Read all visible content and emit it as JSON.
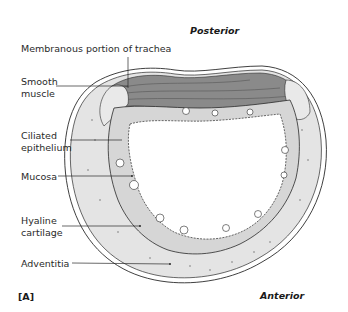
{
  "figure": {
    "panel_label": "[A]",
    "orientation": {
      "top": "Posterior",
      "bottom": "Anterior"
    },
    "labels": {
      "membranous": "Membranous portion of trachea",
      "smooth_muscle_1": "Smooth",
      "smooth_muscle_2": "muscle",
      "ciliated_1": "Ciliated",
      "ciliated_2": "epithelium",
      "mucosa": "Mucosa",
      "hyaline_1": "Hyaline",
      "hyaline_2": "cartilage",
      "adventitia": "Adventitia"
    },
    "colors": {
      "cartilage_fill": "#e4e4e4",
      "mucosa_fill": "#d6d6d6",
      "muscle_fill": "#8a8a8a",
      "outline": "#2a2a2a",
      "lumen": "#ffffff"
    }
  }
}
